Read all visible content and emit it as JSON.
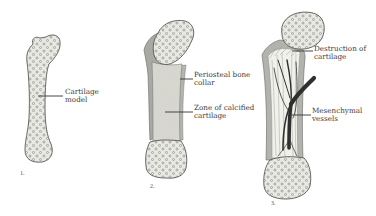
{
  "diagram": {
    "topic": "Endochondral ossification stages",
    "colors": {
      "background": "#ffffff",
      "cartilage_fill": "#e9e9e3",
      "cartilage_dots": "#8d8d86",
      "outline": "#555555",
      "bone_collar": "#a9a9a4",
      "calcified_zone": "#d4d4cd",
      "vessels": "#2f2f2f",
      "leader_line": "#333333",
      "text": "#3a3a3a"
    },
    "stages": [
      {
        "number": "1.",
        "labels": [
          {
            "line1": "Cartilage",
            "line2": "model"
          }
        ]
      },
      {
        "number": "2.",
        "labels": [
          {
            "line1": "Periosteal bone",
            "line2": "collar"
          },
          {
            "line1": "Zone of calcified",
            "line2": "cartilage"
          }
        ]
      },
      {
        "number": "3.",
        "labels": [
          {
            "line1": "Destruction of",
            "line2": "cartilage"
          },
          {
            "line1": "Mesenchymal",
            "line2": "vessels"
          }
        ]
      }
    ]
  }
}
